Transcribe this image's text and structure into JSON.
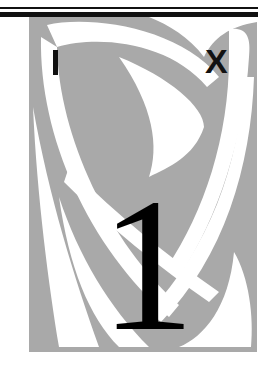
{
  "header": {
    "left_letter": "I",
    "right_letter": "X"
  },
  "main": {
    "numeral": "1"
  },
  "colors": {
    "panel_gray": "#a9a9a9",
    "ink": "#111111",
    "background": "#ffffff"
  }
}
